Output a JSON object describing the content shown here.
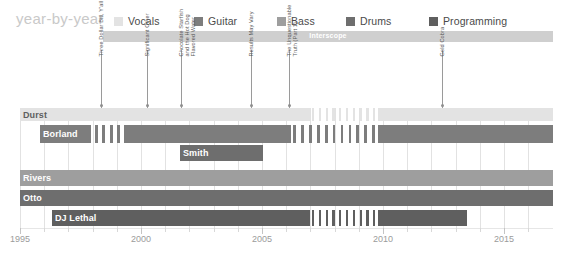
{
  "header": {
    "title": "year-by-year",
    "legend": [
      {
        "label": "Vocals",
        "color": "#e3e3e3",
        "x": 0
      },
      {
        "label": "Guitar",
        "color": "#7d7d7d",
        "x": 80
      },
      {
        "label": "Bass",
        "color": "#9e9e9e",
        "x": 163
      },
      {
        "label": "Drums",
        "color": "#6e6e6e",
        "x": 232
      },
      {
        "label": "Programming",
        "color": "#5f5f5f",
        "x": 315
      }
    ]
  },
  "label_band": {
    "text": "Interscope",
    "x": 103,
    "y": 31,
    "width": 450,
    "color": "#cfcfcf"
  },
  "albums": [
    {
      "name": "Three Dollar Bill, Y'all",
      "year": 1997.5,
      "x": 101,
      "lines": [
        "Three Dollar Bill, Y'all"
      ]
    },
    {
      "name": "Significant Other",
      "year": 1999.4,
      "x": 147,
      "lines": [
        "Significant Other"
      ]
    },
    {
      "name": "Chocolate Starfish and the Hot Dog Flavored Water",
      "year": 2000.8,
      "x": 181,
      "lines": [
        "Chocolate Starfish",
        "and the Hot Dog",
        "Flavored Water"
      ]
    },
    {
      "name": "Results May Vary",
      "year": 2003.6,
      "x": 251,
      "lines": [
        "Results May Vary"
      ]
    },
    {
      "name": "The Unquestionable Truth (Part 1)",
      "year": 2005.2,
      "x": 289,
      "lines": [
        "The Unquestionable",
        "Truth (Part 1)"
      ]
    },
    {
      "name": "Gold Cobra",
      "year": 2011.5,
      "x": 442,
      "lines": [
        "Gold Cobra"
      ]
    }
  ],
  "axis": {
    "years_labeled": [
      1995,
      2000,
      2005,
      2010,
      2015
    ],
    "year_min": 1994,
    "year_max": 2016,
    "px_per_year": 24.2,
    "x_1995": 20
  },
  "chart_data": {
    "type": "bar",
    "title": "year-by-year",
    "xlabel": "",
    "ylabel": "",
    "xlim": [
      1994,
      2016
    ],
    "grid": true,
    "legend_position": "top",
    "categories": [
      "Durst",
      "Borland",
      "Smith",
      "Rivers",
      "Otto",
      "DJ Lethal"
    ],
    "series": [
      {
        "name": "Durst",
        "role": "Vocals",
        "color": "#e3e3e3",
        "row_top": 0,
        "row_height": 13,
        "label_dark": true,
        "segments": [
          {
            "x": 0,
            "w": 290
          },
          {
            "x": 358,
            "w": 175
          }
        ],
        "hiatus": {
          "x": 290,
          "w": 68,
          "bars": 10,
          "color": "#e3e3e3"
        }
      },
      {
        "name": "Borland",
        "role": "Guitar",
        "color": "#7d7d7d",
        "row_top": 17,
        "row_height": 18,
        "label_dark": false,
        "segments": [
          {
            "x": 20,
            "w": 51
          },
          {
            "x": 75,
            "w": 3
          },
          {
            "x": 82,
            "w": 3
          },
          {
            "x": 90,
            "w": 3
          },
          {
            "x": 97,
            "w": 3
          },
          {
            "x": 104,
            "w": 167
          },
          {
            "x": 358,
            "w": 175
          }
        ],
        "hiatus": {
          "x": 271,
          "w": 87,
          "bars": 11,
          "color": "#7d7d7d"
        }
      },
      {
        "name": "Smith",
        "role": "Guitar",
        "color": "#6e6e6e",
        "row_top": 37,
        "row_height": 16,
        "label_dark": false,
        "segments": [
          {
            "x": 160,
            "w": 83
          }
        ],
        "hiatus": null
      },
      {
        "name": "Rivers",
        "role": "Bass",
        "color": "#9e9e9e",
        "row_top": 62,
        "row_height": 16,
        "label_dark": false,
        "segments": [
          {
            "x": 0,
            "w": 290
          },
          {
            "x": 290,
            "w": 243
          }
        ],
        "hiatus": {
          "x": 290,
          "w": 68,
          "bars": 10,
          "color": "#9e9e9e"
        }
      },
      {
        "name": "Otto",
        "role": "Drums",
        "color": "#6e6e6e",
        "row_top": 82,
        "row_height": 16,
        "label_dark": false,
        "segments": [
          {
            "x": 0,
            "w": 290
          },
          {
            "x": 290,
            "w": 243
          }
        ],
        "hiatus": {
          "x": 290,
          "w": 68,
          "bars": 10,
          "color": "#6e6e6e"
        }
      },
      {
        "name": "DJ Lethal",
        "role": "Programming",
        "color": "#5f5f5f",
        "row_top": 102,
        "row_height": 16,
        "label_dark": false,
        "segments": [
          {
            "x": 32,
            "w": 258
          },
          {
            "x": 358,
            "w": 89
          }
        ],
        "hiatus": {
          "x": 290,
          "w": 68,
          "bars": 10,
          "color": "#5f5f5f"
        }
      }
    ]
  }
}
